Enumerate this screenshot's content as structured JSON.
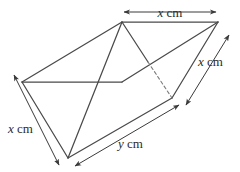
{
  "figure": {
    "kind": "triangular-prism",
    "stroke_color": "#4a4a4a",
    "dashed_color": "#7a7a7a",
    "background_color": "#ffffff",
    "label_color": "#2b2b2b"
  },
  "labels": {
    "top_edge": {
      "variable": "x",
      "unit": "cm"
    },
    "right_edge": {
      "variable": "x",
      "unit": "cm"
    },
    "left_edge": {
      "variable": "x",
      "unit": "cm"
    },
    "bottom_edge": {
      "variable": "y",
      "unit": "cm"
    }
  },
  "geometry": {
    "vertices": {
      "front_left": [
        22,
        82
      ],
      "front_top": [
        122,
        22
      ],
      "front_bottom": [
        68,
        158
      ],
      "back_top": [
        218,
        22
      ],
      "back_bottom": [
        172,
        98
      ],
      "back_hidden": [
        148,
        62
      ]
    },
    "solid_edges": [
      [
        [
          22,
          82
        ],
        [
          122,
          22
        ]
      ],
      [
        [
          22,
          82
        ],
        [
          68,
          158
        ]
      ],
      [
        [
          122,
          22
        ],
        [
          68,
          158
        ]
      ],
      [
        [
          122,
          22
        ],
        [
          218,
          22
        ]
      ],
      [
        [
          68,
          158
        ],
        [
          172,
          98
        ]
      ],
      [
        [
          218,
          22
        ],
        [
          172,
          98
        ]
      ],
      [
        [
          22,
          82
        ],
        [
          122,
          82
        ]
      ],
      [
        [
          122,
          82
        ],
        [
          218,
          22
        ]
      ],
      [
        [
          122,
          22
        ],
        [
          148,
          62
        ]
      ]
    ],
    "dashed_edges": [
      [
        [
          148,
          62
        ],
        [
          172,
          98
        ]
      ]
    ]
  },
  "dimension_lines": {
    "top": {
      "from": [
        122,
        12
      ],
      "to": [
        218,
        12
      ],
      "arrows": "both"
    },
    "right": {
      "from": [
        228,
        34
      ],
      "to": [
        184,
        106
      ],
      "arrows": "both"
    },
    "left": {
      "from": [
        14,
        74
      ],
      "to": [
        60,
        166
      ],
      "arrows": "both"
    },
    "bottom": {
      "from": [
        74,
        166
      ],
      "to": [
        180,
        104
      ],
      "arrows": "both"
    }
  }
}
